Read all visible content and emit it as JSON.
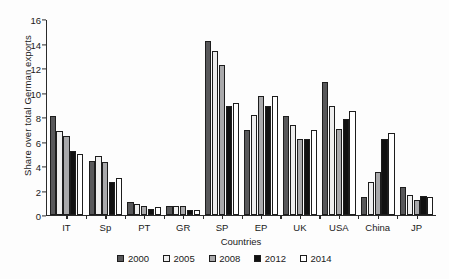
{
  "chart_data": {
    "type": "bar",
    "title": "",
    "xlabel": "Countries",
    "ylabel": "Share over total German exports",
    "ylim": [
      0,
      16
    ],
    "yticks": [
      0,
      2,
      4,
      6,
      8,
      10,
      12,
      14,
      16
    ],
    "grid": false,
    "legend_position": "bottom",
    "categories": [
      "IT",
      "Sp",
      "PT",
      "GR",
      "SP",
      "EP",
      "UK",
      "USA",
      "China",
      "JP"
    ],
    "series": [
      {
        "name": "2000",
        "color": "#58585a",
        "values": [
          8.1,
          4.4,
          1.05,
          0.7,
          14.25,
          7.0,
          8.1,
          10.9,
          1.45,
          2.25
        ]
      },
      {
        "name": "2005",
        "color": "#eeeeee",
        "values": [
          6.9,
          4.8,
          0.85,
          0.7,
          13.45,
          8.2,
          7.4,
          8.95,
          2.65,
          1.6
        ]
      },
      {
        "name": "2008",
        "color": "#a9a9ab",
        "values": [
          6.45,
          4.35,
          0.7,
          0.75,
          12.3,
          9.75,
          6.25,
          7.05,
          3.5,
          1.25
        ]
      },
      {
        "name": "2012",
        "color": "#111111",
        "values": [
          5.2,
          2.7,
          0.5,
          0.4,
          8.95,
          8.9,
          6.25,
          7.9,
          6.25,
          1.5
        ]
      },
      {
        "name": "2014",
        "color": "#ffffff",
        "values": [
          4.95,
          3.05,
          0.6,
          0.4,
          9.2,
          9.75,
          7.0,
          8.5,
          6.75,
          1.45
        ]
      }
    ]
  }
}
